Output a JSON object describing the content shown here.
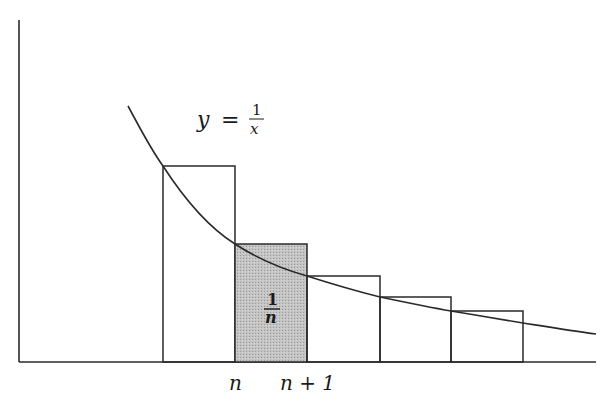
{
  "figure": {
    "curve_label": {
      "lhs": "y",
      "eq": "=",
      "num": "1",
      "den": "x"
    },
    "shaded_label": {
      "num": "1",
      "den": "n"
    },
    "x_labels": [
      {
        "text": "n",
        "x": 235
      },
      {
        "text": "n + 1",
        "x": 307
      }
    ]
  },
  "colors": {
    "stroke": "#2a2a2a",
    "shade": "#bdbdbd",
    "background": "#ffffff"
  },
  "geometry": {
    "axis": {
      "origin_x": 19,
      "baseline_y": 362,
      "top_y": 20,
      "right_x": 596
    },
    "rects": [
      {
        "x0": 163,
        "x1": 235,
        "top": 166,
        "shaded": false
      },
      {
        "x0": 235,
        "x1": 307,
        "top": 244,
        "shaded": true
      },
      {
        "x0": 307,
        "x1": 380,
        "top": 276,
        "shaded": false
      },
      {
        "x0": 380,
        "x1": 451,
        "top": 297,
        "shaded": false
      },
      {
        "x0": 451,
        "x1": 523,
        "top": 311,
        "shaded": false
      }
    ]
  }
}
